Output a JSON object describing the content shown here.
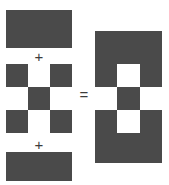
{
  "figure": {
    "colors": {
      "dark": "#4a4a4a",
      "light": "#ffffff",
      "operator": "#3c3c3c",
      "background": "#ffffff"
    },
    "operators": {
      "plus_first": "+",
      "plus_second": "+",
      "equals": "="
    },
    "operands": [
      {
        "name": "top-solid-rectangle",
        "label": "",
        "kind": "solid",
        "fill": "dark",
        "width": 66,
        "height": 38
      },
      {
        "name": "checkerboard-3x3",
        "label": "",
        "kind": "grid",
        "rows": 3,
        "cols": 3,
        "cells": [
          [
            "dark",
            "light",
            "dark"
          ],
          [
            "light",
            "dark",
            "light"
          ],
          [
            "dark",
            "light",
            "dark"
          ]
        ]
      },
      {
        "name": "bottom-solid-rectangle",
        "label": "",
        "kind": "solid",
        "fill": "dark",
        "width": 66,
        "height": 29
      }
    ],
    "result": {
      "name": "composite-result",
      "label": "",
      "bands": [
        {
          "name": "top-band",
          "fill": "dark",
          "height": 33
        },
        {
          "name": "bottom-band",
          "fill": "dark",
          "height": 30
        }
      ],
      "grid": {
        "rows": 3,
        "cols": 3,
        "cells": [
          [
            "dark",
            "light",
            "dark"
          ],
          [
            "light",
            "dark",
            "light"
          ],
          [
            "dark",
            "light",
            "dark"
          ]
        ]
      }
    }
  }
}
